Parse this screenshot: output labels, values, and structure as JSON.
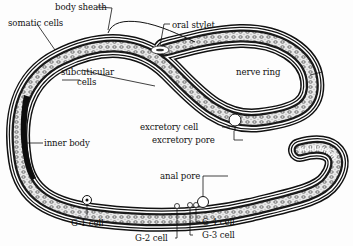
{
  "diagram": {
    "labels": {
      "body_sheath": "body sheath",
      "somatic_cells": "somatic cells",
      "oral_stylet": "oral stylet",
      "subcuticular_cells_1": "subcuticular",
      "subcuticular_cells_2": "cells",
      "nerve_ring": "nerve ring",
      "inner_body": "inner body",
      "excretory_cell": "excretory cell",
      "excretory_pore": "excretory pore",
      "anal_pore": "anal pore",
      "g1_cell": "G-1 cell",
      "g2_cell": "G-2 cell",
      "g3_cell": "G-3 cell",
      "g4_cell": "G-4 cell"
    },
    "colors": {
      "ink": "#111111",
      "background": "#fdfdfd",
      "body_fill": "#e8e8e8"
    }
  }
}
